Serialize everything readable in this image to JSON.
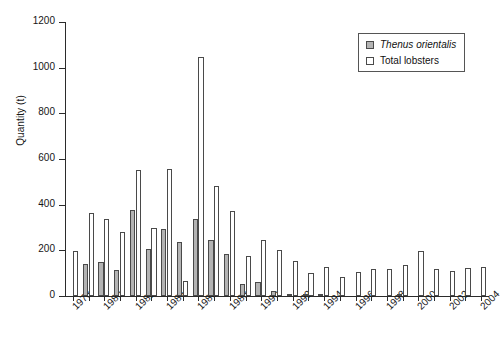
{
  "chart_data": {
    "type": "bar",
    "title": "",
    "xlabel": "",
    "ylabel": "Quantity (t)",
    "ylim": [
      0,
      1200
    ],
    "yticks": [
      0,
      200,
      400,
      600,
      800,
      1000,
      1200
    ],
    "grid": false,
    "legend_position": "top-right",
    "categories": [
      "1978",
      "1979",
      "1980",
      "1981",
      "1982",
      "1983",
      "1984",
      "1985",
      "1986",
      "1987",
      "1988",
      "1989",
      "1990",
      "1991",
      "1992",
      "1993",
      "1994",
      "1995",
      "1996",
      "1997",
      "1998",
      "1999",
      "2000",
      "2001",
      "2002",
      "2003",
      "2004"
    ],
    "tick_labels": [
      "1978",
      "",
      "1980",
      "",
      "1982",
      "",
      "1984",
      "",
      "1986",
      "",
      "1988",
      "",
      "1990",
      "",
      "1992",
      "",
      "1994",
      "",
      "1996",
      "",
      "1998",
      "",
      "2000",
      "",
      "2002",
      "",
      "2004"
    ],
    "series": [
      {
        "name": "Thenus orientalis",
        "color": "#b4b4b4",
        "values": [
          0,
          140,
          147,
          115,
          378,
          207,
          293,
          237,
          337,
          245,
          186,
          54,
          62,
          22,
          7,
          10,
          5,
          0,
          0,
          0,
          0,
          9,
          0,
          0,
          0,
          0,
          0
        ]
      },
      {
        "name": "Total lobsters",
        "color": "#ffffff",
        "values": [
          197,
          364,
          337,
          281,
          550,
          297,
          555,
          65,
          1045,
          481,
          373,
          176,
          247,
          201,
          152,
          101,
          126,
          84,
          106,
          118,
          118,
          136,
          195,
          119,
          108,
          124,
          127
        ]
      }
    ]
  },
  "legend": {
    "items": [
      {
        "label": "Thenus orientalis",
        "style": "italic"
      },
      {
        "label": "Total lobsters",
        "style": "normal"
      }
    ]
  },
  "axis": {
    "y_title": "Quantity (t)",
    "y_tick_labels": [
      "0",
      "200",
      "400",
      "600",
      "800",
      "1000",
      "1200"
    ]
  }
}
